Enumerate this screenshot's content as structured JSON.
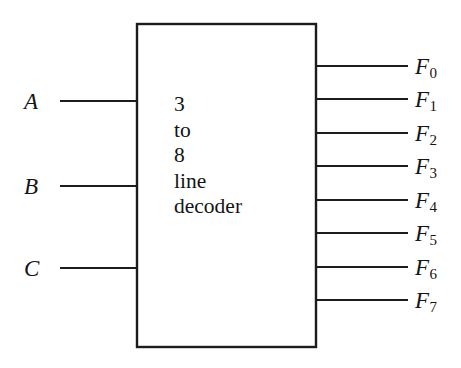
{
  "diagram": {
    "background_color": "#ffffff",
    "line_color": "#1c1c1c",
    "block": {
      "name": "decoder-block",
      "text_lines": [
        "3",
        "to",
        "8",
        "line",
        "decoder"
      ],
      "x": 137,
      "y": 24,
      "width": 179,
      "height": 323
    },
    "inputs": [
      {
        "label": "A",
        "y": 101
      },
      {
        "label": "B",
        "y": 186
      },
      {
        "label": "C",
        "y": 268
      }
    ],
    "outputs": [
      {
        "base": "F",
        "sub": "0",
        "y": 66
      },
      {
        "base": "F",
        "sub": "1",
        "y": 99
      },
      {
        "base": "F",
        "sub": "2",
        "y": 133
      },
      {
        "base": "F",
        "sub": "3",
        "y": 166
      },
      {
        "base": "F",
        "sub": "4",
        "y": 200
      },
      {
        "base": "F",
        "sub": "5",
        "y": 233
      },
      {
        "base": "F",
        "sub": "6",
        "y": 267
      },
      {
        "base": "F",
        "sub": "7",
        "y": 300
      }
    ]
  }
}
